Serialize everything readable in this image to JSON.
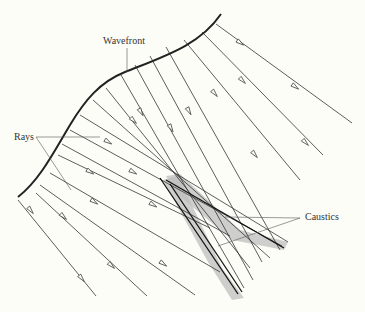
{
  "diagram": {
    "labels": {
      "wavefront": "Wavefront",
      "rays": "Rays",
      "caustics": "Caustics"
    },
    "colors": {
      "background": "#fdfdf8",
      "line": "#333333",
      "wavefront": "#222222",
      "caustic_shade": "#b8b8b8"
    }
  }
}
